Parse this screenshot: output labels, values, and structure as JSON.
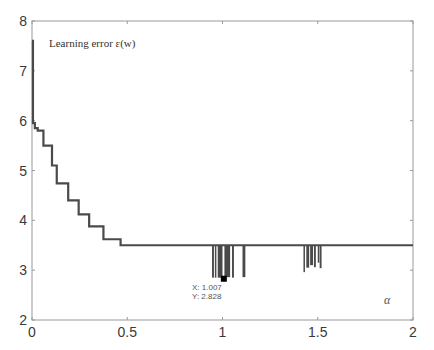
{
  "chart_data": {
    "type": "line",
    "title": "",
    "annotation": "Learning error ε(w)",
    "xlabel": "α",
    "ylabel": "",
    "xlim": [
      0,
      2
    ],
    "ylim": [
      2,
      8
    ],
    "grid": false,
    "x_ticks": [
      "0",
      "0.5",
      "1",
      "1.5",
      "2"
    ],
    "y_ticks": [
      "2",
      "3",
      "4",
      "5",
      "6",
      "7",
      "8"
    ],
    "series": [
      {
        "name": "Learning error",
        "color": "#4a4a4a",
        "steps": [
          {
            "x": 0.0,
            "y": 7.6
          },
          {
            "x": 0.005,
            "y": 5.95
          },
          {
            "x": 0.015,
            "y": 5.85
          },
          {
            "x": 0.03,
            "y": 5.8
          },
          {
            "x": 0.06,
            "y": 5.5
          },
          {
            "x": 0.105,
            "y": 5.1
          },
          {
            "x": 0.13,
            "y": 4.74
          },
          {
            "x": 0.19,
            "y": 4.4
          },
          {
            "x": 0.245,
            "y": 4.12
          },
          {
            "x": 0.3,
            "y": 3.88
          },
          {
            "x": 0.375,
            "y": 3.62
          },
          {
            "x": 0.465,
            "y": 3.5
          },
          {
            "x": 2.0,
            "y": 3.5
          }
        ],
        "dips": [
          {
            "x_start": 0.945,
            "x_end": 0.955,
            "min": 2.85
          },
          {
            "x_start": 0.96,
            "x_end": 0.965,
            "min": 2.85
          },
          {
            "x_start": 0.975,
            "x_end": 1.0,
            "min": 2.85
          },
          {
            "x_start": 1.01,
            "x_end": 1.04,
            "min": 2.86
          },
          {
            "x_start": 1.05,
            "x_end": 1.06,
            "min": 2.85
          },
          {
            "x_start": 1.105,
            "x_end": 1.12,
            "min": 2.86
          },
          {
            "x_start": 1.425,
            "x_end": 1.43,
            "min": 2.96
          },
          {
            "x_start": 1.44,
            "x_end": 1.455,
            "min": 3.05
          },
          {
            "x_start": 1.46,
            "x_end": 1.475,
            "min": 3.1
          },
          {
            "x_start": 1.48,
            "x_end": 1.49,
            "min": 3.06
          },
          {
            "x_start": 1.5,
            "x_end": 1.505,
            "min": 3.15
          },
          {
            "x_start": 1.51,
            "x_end": 1.52,
            "min": 3.04
          }
        ]
      }
    ],
    "datatip": {
      "x": 1.007,
      "y": 2.828,
      "x_label": "X: 1.007",
      "y_label": "Y: 2.828"
    }
  },
  "labels": {
    "legend": "Learning error ε(w)",
    "xaxis": "α",
    "tip_x": "X: 1.007",
    "tip_y": "Y: 2.828",
    "xticks": [
      "0",
      "0.5",
      "1",
      "1.5",
      "2"
    ],
    "yticks": [
      "2",
      "3",
      "4",
      "5",
      "6",
      "7",
      "8"
    ]
  }
}
